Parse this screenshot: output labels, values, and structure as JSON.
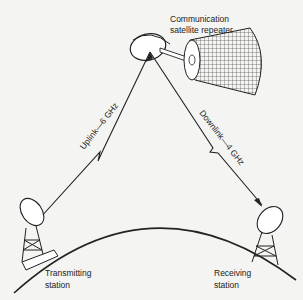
{
  "diagram": {
    "satellite_label_line1": "Communication",
    "satellite_label_line2": "satellite repeater",
    "uplink_label": "Uplink—6 GHz",
    "downlink_label": "Downlink—4 GHz",
    "transmitting_label_line1": "Transmitting",
    "transmitting_label_line2": "station",
    "receiving_label_line1": "Receiving",
    "receiving_label_line2": "station",
    "colors": {
      "ink": "#222222",
      "background": "#f4f4f2"
    }
  }
}
